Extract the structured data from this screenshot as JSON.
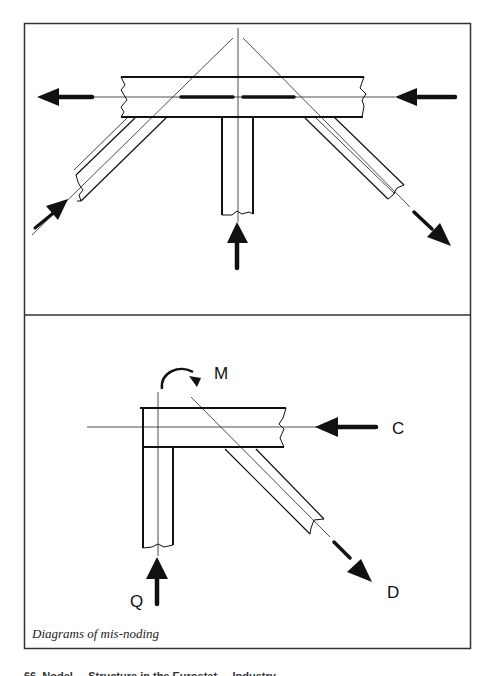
{
  "figure": {
    "caption": "Diagrams of mis-noding",
    "footer_fragment": "66. Nodal ... Structure in the Eurostat ... Industry",
    "colors": {
      "line": "#111111",
      "frame": "#333333",
      "background": "#ffffff"
    },
    "top_panel": {
      "description": "Chord with vertical post and two diagonal braces whose centroidal axes do not meet at a single node",
      "forces": [
        {
          "name": "left-chord-force",
          "direction": "left"
        },
        {
          "name": "right-chord-force",
          "direction": "left"
        },
        {
          "name": "left-brace-force",
          "direction": "up-right"
        },
        {
          "name": "post-force",
          "direction": "up"
        },
        {
          "name": "right-brace-force",
          "direction": "down-right"
        }
      ]
    },
    "bottom_panel": {
      "description": "Corner joint with column, chord and diagonal; eccentricity creates moment M",
      "labels": {
        "moment": "M",
        "chord": "C",
        "column": "Q",
        "diagonal": "D"
      }
    }
  }
}
